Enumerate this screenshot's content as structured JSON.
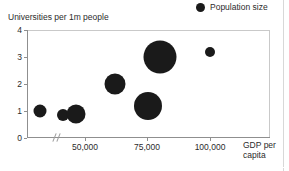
{
  "legend": {
    "marker_icon": "filled-circle-icon",
    "label": "Population size"
  },
  "axes": {
    "y_title": "Universities per 1m people",
    "x_title": "GDP per capita",
    "y_ticks": [
      "0",
      "1",
      "2",
      "3",
      "4"
    ],
    "x_ticks": [
      "50,000",
      "75,000",
      "100,000"
    ],
    "axis_break": "//"
  },
  "colors": {
    "bubble": "#1a1a1a",
    "axis": "#8f8f8f",
    "frame": "#c9c9c9",
    "text": "#2b2b2b",
    "background": "#ffffff"
  },
  "chart_data": {
    "type": "scatter",
    "title": "",
    "xlabel": "GDP per capita",
    "ylabel": "Universities per 1m people",
    "xlim": [
      25000,
      122000
    ],
    "ylim": [
      0,
      4
    ],
    "x_ticks": [
      50000,
      75000,
      100000
    ],
    "y_ticks": [
      0,
      1,
      2,
      3,
      4
    ],
    "grid": false,
    "axis_break_x": true,
    "legend": {
      "position": "top-right",
      "entries": [
        "Population size"
      ],
      "size_encoding": "Population size"
    },
    "size_unit": "bubble radius in px encodes population size",
    "points": [
      {
        "x": 32000,
        "y": 1.0,
        "r": 6.5
      },
      {
        "x": 41000,
        "y": 0.85,
        "r": 6.0
      },
      {
        "x": 46500,
        "y": 0.9,
        "r": 9.5
      },
      {
        "x": 62000,
        "y": 2.0,
        "r": 10.5
      },
      {
        "x": 75000,
        "y": 1.2,
        "r": 14.0
      },
      {
        "x": 80000,
        "y": 3.0,
        "r": 16.5
      },
      {
        "x": 100000,
        "y": 3.2,
        "r": 5.0
      }
    ]
  }
}
